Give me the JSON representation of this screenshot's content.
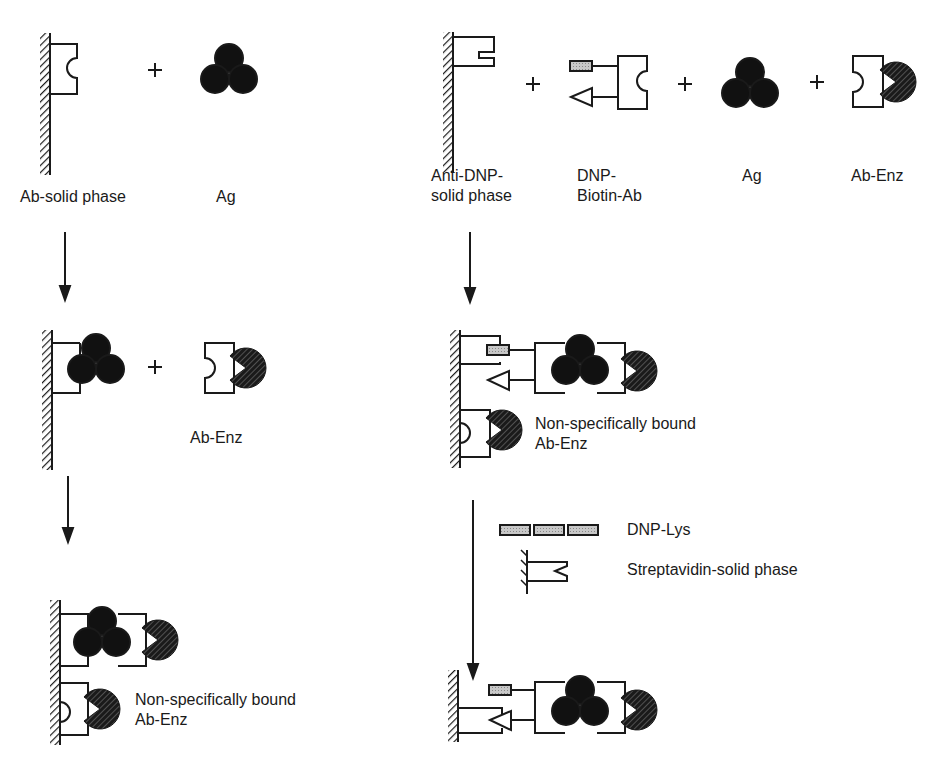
{
  "left_panel": {
    "step1": {
      "reactants": [
        {
          "label": "Ab-solid phase"
        },
        {
          "label": "Ag"
        }
      ],
      "operator": "+"
    },
    "step2": {
      "operator": "+",
      "reagent_label": "Ab-Enz"
    },
    "step3": {
      "nonspecific_label_line1": "Non-specifically bound",
      "nonspecific_label_line2": "Ab-Enz"
    }
  },
  "right_panel": {
    "step1": {
      "reactants": [
        {
          "label_line1": "Anti-DNP-",
          "label_line2": "solid phase"
        },
        {
          "label_line1": "DNP-",
          "label_line2": "Biotin-Ab"
        },
        {
          "label_line1": "Ag",
          "label_line2": ""
        },
        {
          "label_line1": "Ab-Enz",
          "label_line2": ""
        }
      ],
      "operator": "+"
    },
    "step2": {
      "nonspecific_label_line1": "Non-specifically bound",
      "nonspecific_label_line2": "Ab-Enz"
    },
    "transfer_reagents": {
      "dnp_lys_label": "DNP-Lys",
      "streptavidin_label": "Streptavidin-solid phase"
    }
  },
  "legend_colors": {
    "antigen": "#111111",
    "enzyme_hatch": "#222222",
    "dnp_fill": "#bdbdbd",
    "line": "#1a1a1a"
  }
}
